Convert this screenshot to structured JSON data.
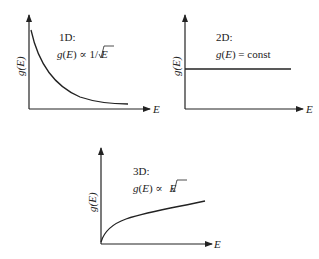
{
  "panels": [
    {
      "id": "1d",
      "title": "1D:",
      "formula": {
        "prefix": "g(E) ∝ 1/",
        "sqrt_arg": "E"
      },
      "ylabel": "g(E)",
      "xlabel": "E",
      "curve": "g(E) proportional to 1/sqrt(E)"
    },
    {
      "id": "2d",
      "title": "2D:",
      "formula": {
        "text": "g(E) = const"
      },
      "ylabel": "g(E)",
      "xlabel": "E",
      "curve": "constant horizontal line"
    },
    {
      "id": "3d",
      "title": "3D:",
      "formula": {
        "prefix": "g(E) ∝ ",
        "sqrt_arg": "E"
      },
      "ylabel": "g(E)",
      "xlabel": "E",
      "curve": "g(E) proportional to sqrt(E)"
    }
  ],
  "colors": {
    "line": "#222222",
    "background": "#ffffff"
  }
}
